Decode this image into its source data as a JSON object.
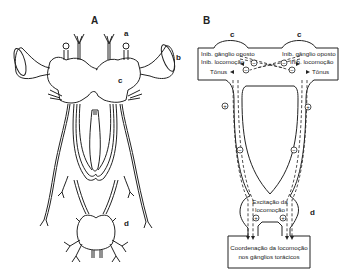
{
  "panels": {
    "A": {
      "label": "A",
      "parts": {
        "a": "a",
        "b": "b",
        "c": "c",
        "d": "d"
      }
    },
    "B": {
      "label": "B",
      "parts": {
        "c_left": "c",
        "c_right": "c",
        "d": "d"
      },
      "left_labels": {
        "inhib_opposite": "Inib. gânglio oposto",
        "inhib_locomotion": "Inib. locomoção",
        "tonus": "Tônus"
      },
      "right_labels": {
        "inhib_opposite": "Inib. gânglio oposto",
        "inhib_locomotion": "Inib. locomoção",
        "tonus": "Tônus"
      },
      "excitation_line1": "Excitação da",
      "excitation_line2": "locomoção",
      "coordination_line1": "Coordenação da locomoção",
      "coordination_line2": "nos gânglios torácicos",
      "symbols": {
        "plus": "+",
        "minus": "−"
      }
    }
  },
  "colors": {
    "ink": "#222222",
    "background": "#ffffff"
  }
}
